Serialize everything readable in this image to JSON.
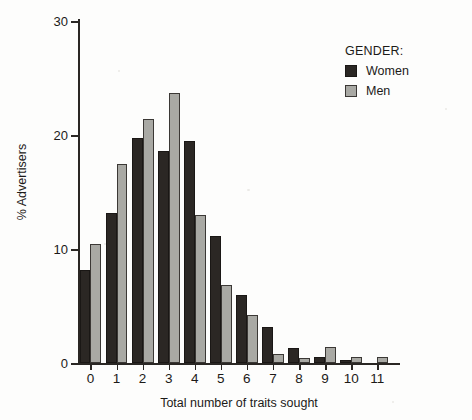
{
  "chart_data": {
    "type": "bar",
    "title": "",
    "xlabel": "Total number of traits sought",
    "ylabel": "% Advertisers",
    "categories": [
      "0",
      "1",
      "2",
      "3",
      "4",
      "5",
      "6",
      "7",
      "8",
      "9",
      "10",
      "11"
    ],
    "series": [
      {
        "name": "Women",
        "color": "#2b2724",
        "values": [
          8.2,
          13.2,
          19.7,
          18.6,
          19.5,
          11.1,
          6.0,
          3.2,
          1.3,
          0.5,
          0.3,
          0.0
        ]
      },
      {
        "name": "Men",
        "color": "#a9a9a4",
        "values": [
          10.4,
          17.5,
          21.4,
          23.7,
          13.0,
          6.8,
          4.2,
          0.8,
          0.4,
          1.4,
          0.5,
          0.5
        ]
      }
    ],
    "ylim": [
      0,
      30
    ],
    "yticks": [
      0,
      10,
      20,
      30
    ],
    "ytick_labels": [
      "0",
      "10",
      "20",
      "30"
    ],
    "grid": false,
    "legend_position": "top-right"
  },
  "legend": {
    "title": "GENDER:",
    "entries": [
      {
        "label": "Women",
        "swatch": "women"
      },
      {
        "label": "Men",
        "swatch": "men"
      }
    ]
  },
  "axes": {
    "x_title": "Total number of traits sought",
    "y_title": "% Advertisers"
  },
  "colors": {
    "women": "#2b2724",
    "men": "#a9a9a4",
    "axis": "#2a2724",
    "background": "#fdfdfc"
  }
}
